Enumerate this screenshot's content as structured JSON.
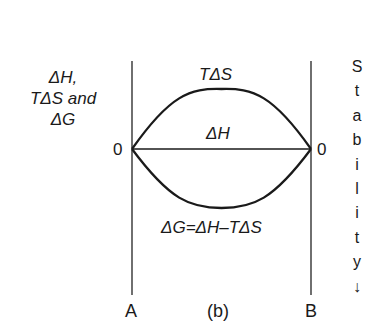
{
  "figure": {
    "panel_label": "(b)",
    "y_axis_label": {
      "line1": "ΔH,",
      "line2": "TΔS and",
      "line3": "ΔG"
    },
    "left_zero": "0",
    "right_zero": "0",
    "left_end_label": "A",
    "right_end_label": "B",
    "curves": {
      "upper_label": "TΔS",
      "middle_label": "ΔH",
      "lower_label": "ΔG=ΔH–TΔS"
    },
    "stability_label": {
      "letters": [
        "S",
        "t",
        "a",
        "b",
        "i",
        "l",
        "i",
        "t",
        "y"
      ],
      "arrow": "↓"
    },
    "colors": {
      "line": "#1a1a1a",
      "axis": "#333333",
      "background": "#ffffff"
    }
  }
}
